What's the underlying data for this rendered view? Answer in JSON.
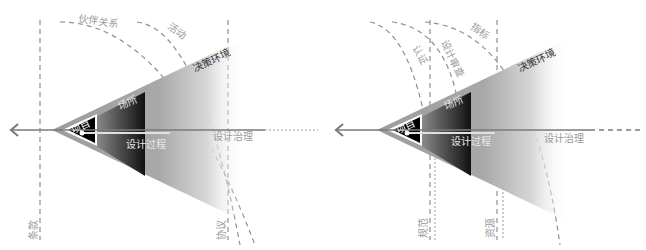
{
  "diagrams": [
    {
      "id": "left",
      "labels": {
        "partnership": "伙伴关系",
        "activity": "活动",
        "decision_env": "决策环境",
        "venue": "场所",
        "project": "项目",
        "design_process": "设计过程",
        "design_governance": "设计治理",
        "clause": "条款",
        "agreement": "协议"
      }
    },
    {
      "id": "right",
      "labels": {
        "indicators": "指标",
        "certification": "认证",
        "design_review": "设计审查",
        "decision_env": "决策环境",
        "venue": "场所",
        "project": "项目",
        "design_process": "设计过程",
        "design_governance": "设计治理",
        "norms": "规范",
        "resources": "资源"
      }
    }
  ],
  "colors": {
    "cone_dark": "#1a1a1a",
    "cone_mid": "#8a8a8a",
    "cone_light": "#bdbdbd",
    "axis": "#7a7a7a",
    "dash": "#8f8f8f"
  }
}
